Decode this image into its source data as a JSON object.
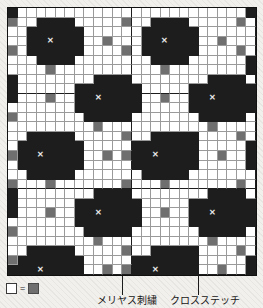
{
  "legend": {
    "blank_swatch_name": "white-cell",
    "equals": "=",
    "gray_swatch_name": "gray-cell"
  },
  "callouts": [
    {
      "id": "meriyasu",
      "label": "メリヤス刺繍",
      "points_to": "gray-cell"
    },
    {
      "id": "cross",
      "label": "クロスステッチ",
      "points_to": "dark-cell-with-x"
    }
  ],
  "colors": {
    "background": "#f2f0ec",
    "cell_white": "#ffffff",
    "cell_gray": "#6f6f6f",
    "cell_dark": "#1d1d1d",
    "gridline": "#9a9a9a",
    "heavy_gridline": "#1b1b1b",
    "x_mark": "#e8e8e8",
    "text": "#161616"
  },
  "chart_data": {
    "type": "heatmap",
    "title": "",
    "subtitle": "",
    "xlabel": "",
    "ylabel": "",
    "cols": 26,
    "rows": 28,
    "legend_position": "bottom-left",
    "grid": true,
    "heavy_col_lines": [
      12,
      25
    ],
    "heavy_row_lines": [
      8,
      18,
      27
    ],
    "value_legend": {
      "0": "blank / stockinette ground",
      "1": "gray — メリヤス刺繍 (duplicate stitch)",
      "2": "dark — motif fill",
      "3": "dark with X — クロスステッチ (cross stitch)"
    },
    "x_marks": [
      {
        "row": 3,
        "col": 4
      },
      {
        "row": 3,
        "col": 16
      },
      {
        "row": 8,
        "col": 10
      },
      {
        "row": 8,
        "col": 22
      },
      {
        "row": 13,
        "col": 4
      },
      {
        "row": 13,
        "col": 16
      },
      {
        "row": 18,
        "col": 10
      },
      {
        "row": 18,
        "col": 22
      },
      {
        "row": 23,
        "col": 4
      },
      {
        "row": 23,
        "col": 16
      },
      {
        "row": 27,
        "col": 10
      },
      {
        "row": 27,
        "col": 22
      }
    ],
    "values": [
      [
        2,
        0,
        0,
        0,
        0,
        0,
        0,
        0,
        0,
        0,
        0,
        0,
        0,
        0,
        0,
        0,
        0,
        0,
        0,
        0,
        0,
        0,
        0,
        0,
        0,
        2
      ],
      [
        1,
        0,
        0,
        2,
        2,
        2,
        2,
        0,
        0,
        0,
        0,
        0,
        1,
        0,
        0,
        2,
        2,
        2,
        2,
        0,
        0,
        0,
        0,
        0,
        1,
        0
      ],
      [
        0,
        0,
        2,
        2,
        2,
        2,
        2,
        2,
        0,
        0,
        0,
        0,
        0,
        0,
        2,
        2,
        2,
        2,
        2,
        2,
        0,
        0,
        0,
        0,
        0,
        0
      ],
      [
        0,
        0,
        2,
        2,
        3,
        2,
        2,
        2,
        0,
        0,
        1,
        0,
        0,
        0,
        2,
        2,
        3,
        2,
        2,
        2,
        0,
        0,
        1,
        0,
        0,
        0
      ],
      [
        1,
        0,
        2,
        2,
        2,
        2,
        2,
        2,
        0,
        0,
        0,
        0,
        1,
        0,
        2,
        2,
        2,
        2,
        2,
        2,
        0,
        0,
        0,
        0,
        1,
        0
      ],
      [
        0,
        0,
        0,
        2,
        2,
        2,
        2,
        0,
        0,
        0,
        0,
        0,
        0,
        0,
        0,
        2,
        2,
        2,
        2,
        0,
        0,
        0,
        0,
        0,
        0,
        2
      ],
      [
        0,
        0,
        0,
        0,
        1,
        0,
        0,
        0,
        0,
        0,
        0,
        0,
        0,
        0,
        0,
        0,
        1,
        0,
        0,
        0,
        0,
        0,
        0,
        0,
        0,
        2
      ],
      [
        2,
        0,
        0,
        0,
        0,
        0,
        0,
        0,
        0,
        2,
        2,
        2,
        2,
        0,
        0,
        0,
        0,
        0,
        0,
        0,
        0,
        2,
        2,
        2,
        2,
        0
      ],
      [
        2,
        0,
        0,
        0,
        0,
        0,
        0,
        2,
        2,
        2,
        2,
        2,
        2,
        2,
        0,
        0,
        0,
        0,
        0,
        2,
        2,
        2,
        2,
        2,
        2,
        2
      ],
      [
        2,
        0,
        0,
        0,
        1,
        0,
        0,
        2,
        2,
        3,
        2,
        2,
        2,
        2,
        0,
        0,
        1,
        0,
        0,
        2,
        2,
        3,
        2,
        2,
        2,
        2
      ],
      [
        0,
        0,
        0,
        0,
        0,
        0,
        0,
        2,
        2,
        2,
        2,
        2,
        2,
        2,
        0,
        0,
        0,
        0,
        0,
        2,
        2,
        2,
        2,
        2,
        2,
        2
      ],
      [
        1,
        0,
        0,
        0,
        0,
        0,
        0,
        0,
        2,
        2,
        2,
        2,
        2,
        0,
        0,
        0,
        0,
        0,
        0,
        0,
        2,
        2,
        2,
        2,
        2,
        0
      ],
      [
        0,
        0,
        0,
        0,
        0,
        0,
        0,
        0,
        0,
        1,
        0,
        0,
        0,
        0,
        0,
        0,
        0,
        0,
        0,
        0,
        0,
        1,
        0,
        0,
        0,
        0
      ],
      [
        0,
        0,
        2,
        2,
        2,
        2,
        2,
        0,
        0,
        0,
        0,
        0,
        1,
        0,
        0,
        2,
        2,
        2,
        2,
        2,
        0,
        0,
        0,
        0,
        1,
        0
      ],
      [
        0,
        2,
        2,
        2,
        2,
        2,
        2,
        2,
        0,
        0,
        0,
        0,
        0,
        2,
        2,
        2,
        2,
        2,
        2,
        2,
        0,
        0,
        0,
        0,
        0,
        2
      ],
      [
        1,
        2,
        2,
        3,
        2,
        2,
        2,
        2,
        0,
        0,
        1,
        0,
        1,
        2,
        2,
        3,
        2,
        2,
        2,
        2,
        0,
        0,
        1,
        0,
        0,
        2
      ],
      [
        0,
        2,
        2,
        2,
        2,
        2,
        2,
        2,
        0,
        0,
        0,
        0,
        0,
        2,
        2,
        2,
        2,
        2,
        2,
        2,
        0,
        0,
        0,
        0,
        0,
        2
      ],
      [
        0,
        0,
        2,
        2,
        2,
        2,
        2,
        0,
        0,
        0,
        0,
        0,
        0,
        0,
        2,
        2,
        2,
        2,
        2,
        0,
        0,
        0,
        0,
        0,
        0,
        0
      ],
      [
        1,
        0,
        0,
        0,
        1,
        0,
        0,
        0,
        0,
        0,
        0,
        0,
        1,
        0,
        0,
        0,
        1,
        0,
        0,
        0,
        0,
        0,
        0,
        0,
        1,
        0
      ],
      [
        2,
        0,
        0,
        0,
        0,
        0,
        0,
        0,
        0,
        2,
        2,
        2,
        2,
        0,
        0,
        0,
        0,
        0,
        0,
        0,
        0,
        2,
        2,
        2,
        2,
        0
      ],
      [
        2,
        0,
        0,
        0,
        0,
        0,
        0,
        2,
        2,
        2,
        2,
        2,
        2,
        2,
        0,
        0,
        0,
        0,
        0,
        2,
        2,
        2,
        2,
        2,
        2,
        2
      ],
      [
        2,
        0,
        0,
        0,
        1,
        0,
        0,
        2,
        2,
        3,
        2,
        2,
        2,
        2,
        0,
        0,
        1,
        0,
        0,
        2,
        2,
        3,
        2,
        2,
        2,
        2
      ],
      [
        0,
        0,
        0,
        0,
        0,
        0,
        0,
        2,
        2,
        2,
        2,
        2,
        2,
        2,
        0,
        0,
        0,
        0,
        0,
        2,
        2,
        2,
        2,
        2,
        2,
        2
      ],
      [
        1,
        0,
        0,
        0,
        0,
        0,
        0,
        0,
        2,
        2,
        2,
        2,
        2,
        0,
        0,
        0,
        0,
        0,
        0,
        0,
        2,
        2,
        2,
        2,
        2,
        0
      ],
      [
        0,
        0,
        0,
        0,
        0,
        0,
        0,
        0,
        0,
        1,
        0,
        0,
        0,
        0,
        0,
        0,
        0,
        0,
        0,
        0,
        0,
        1,
        0,
        0,
        0,
        0
      ],
      [
        0,
        0,
        2,
        2,
        2,
        2,
        2,
        0,
        0,
        0,
        0,
        0,
        1,
        0,
        0,
        2,
        2,
        2,
        2,
        2,
        0,
        0,
        0,
        0,
        1,
        0
      ],
      [
        1,
        2,
        2,
        2,
        2,
        2,
        2,
        2,
        0,
        0,
        0,
        0,
        0,
        2,
        2,
        2,
        2,
        2,
        2,
        2,
        0,
        0,
        0,
        0,
        0,
        2
      ],
      [
        2,
        2,
        2,
        3,
        2,
        2,
        2,
        2,
        0,
        0,
        1,
        0,
        1,
        2,
        2,
        3,
        2,
        2,
        2,
        2,
        0,
        0,
        1,
        0,
        0,
        2
      ]
    ]
  }
}
